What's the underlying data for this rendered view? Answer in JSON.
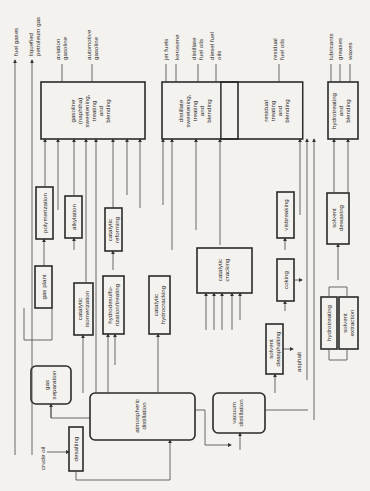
{
  "diagram": {
    "orientation": "rotated 90 degrees counter-clockwise",
    "colors": {
      "background": "#f4f2ee",
      "stroke": "#2a2a2a"
    },
    "inputs": {
      "crude_oil": "crude oil"
    },
    "units": {
      "desalting": "desalting",
      "atmospheric_distillation": [
        "atmospheric",
        "distillation"
      ],
      "vacuum_distillation": [
        "vacuum",
        "distillation"
      ],
      "gas_separation": [
        "gas",
        "separation"
      ],
      "gas_plant": "gas plant",
      "polymerization": "polymerization",
      "alkylation": "alkylation",
      "catalytic_isomerization": [
        "catalytic",
        "isomerization"
      ],
      "catalytic_reforming": [
        "catalytic",
        "reforming"
      ],
      "hydrodesulfurization": [
        "hydrodesulfu-",
        "rization/treating"
      ],
      "catalytic_hydrocracking": [
        "catalytic",
        "hydrocracking"
      ],
      "catalytic_cracking": [
        "catalytic",
        "cracking"
      ],
      "visbreaking": "visbreaking",
      "coking": "coking",
      "solvent_deasphalting": [
        "solvent",
        "deasphalting"
      ],
      "hydrotreating": "hydrotreating",
      "solvent_extraction": [
        "solvent",
        "extraction"
      ],
      "solvent_dewaxing": [
        "solvent",
        "dewaxing"
      ],
      "gasoline_blending": [
        "gasoline",
        "(naphtha)",
        "sweetening,",
        "treating",
        "and",
        "blending"
      ],
      "distillate_blending": [
        "distillate",
        "sweetening,",
        "treating",
        "and",
        "blending"
      ],
      "residual_blending": [
        "residual",
        "treating",
        "and",
        "blending"
      ],
      "lube_blending": [
        "hydrotreating",
        "and",
        "blending"
      ]
    },
    "products": {
      "fuel_gases": "fuel gases",
      "lpg": [
        "liquefied",
        "petroleum gas"
      ],
      "aviation_gasoline": [
        "aviation",
        "gasoline"
      ],
      "automotive_gasoline": [
        "automotive",
        "gasoline"
      ],
      "jet_fuels": "jet fuels",
      "kerosene": "kerosene",
      "distillate_fuel_oils": [
        "distillate",
        "fuel oils"
      ],
      "diesel_fuel_oils": [
        "diesel fuel",
        "oils"
      ],
      "residual_fuel_oils": [
        "residual",
        "fuel oils"
      ],
      "lubricants": "lubricants",
      "greases": "greases",
      "waxes": "waxes",
      "asphalt": "asphalt"
    }
  }
}
